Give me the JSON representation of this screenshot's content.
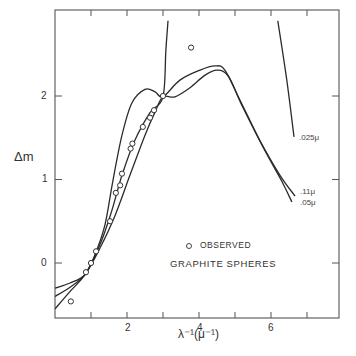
{
  "chart_data": {
    "type": "line",
    "title": "",
    "xlabel": "λ⁻¹(μ⁻¹)",
    "ylabel": "Δm",
    "xlim": [
      0,
      7.8
    ],
    "ylim": [
      -0.66,
      2.9
    ],
    "x_ticks": [
      1,
      2,
      3,
      4,
      5,
      6,
      7
    ],
    "x_tick_labels": [
      {
        "value": 2,
        "label": "2"
      },
      {
        "value": 4,
        "label": "4"
      },
      {
        "value": 6,
        "label": "6"
      }
    ],
    "y_ticks": [
      0,
      1,
      2
    ],
    "y_tick_labels": [
      {
        "value": 0,
        "label": "0"
      },
      {
        "value": 1,
        "label": "1"
      },
      {
        "value": 2,
        "label": "2"
      }
    ],
    "grid": false,
    "annotations": [
      {
        "text": "OBSERVED",
        "marker": "circle"
      },
      {
        "text": "GRAPHITE SPHERES"
      }
    ],
    "series": [
      {
        "name": ".11μ",
        "kind": "line",
        "x": [
          0,
          0.42,
          0.83,
          1.11,
          1.39,
          1.61,
          1.86,
          2.14,
          2.5,
          2.78,
          3.0,
          3.47,
          4.03,
          4.44,
          4.72,
          5.14,
          5.69,
          6.25,
          6.67
        ],
        "y": [
          -0.3,
          -0.24,
          -0.14,
          0.1,
          0.46,
          0.99,
          1.53,
          1.92,
          2.08,
          2.05,
          1.99,
          2.19,
          2.31,
          2.36,
          2.31,
          1.95,
          1.47,
          1.05,
          0.8
        ]
      },
      {
        "name": ".05μ",
        "kind": "line",
        "x": [
          0,
          0.42,
          0.83,
          1.25,
          1.67,
          2.08,
          2.5,
          2.78,
          3.0,
          3.33,
          3.75,
          4.17,
          4.5,
          4.81,
          5.19,
          5.75,
          6.31,
          6.58
        ],
        "y": [
          -0.4,
          -0.29,
          -0.14,
          0.18,
          0.57,
          1.05,
          1.53,
          1.81,
          1.99,
          1.99,
          2.1,
          2.25,
          2.31,
          2.24,
          1.89,
          1.41,
          0.97,
          0.73
        ]
      },
      {
        "name": ".025μ",
        "kind": "line",
        "segments": [
          {
            "x": [
              0,
              0.42,
              0.83,
              1.25,
              1.58,
              1.86,
              2.22,
              2.64,
              3.0,
              3.08,
              3.14
            ],
            "y": [
              -0.55,
              -0.34,
              -0.14,
              0.22,
              0.63,
              1.05,
              1.47,
              1.8,
              1.99,
              2.55,
              2.9
            ]
          },
          {
            "x": [
              6.19,
              6.44,
              6.64
            ],
            "y": [
              2.9,
              2.19,
              1.51
            ]
          }
        ]
      },
      {
        "name": "Observed",
        "kind": "scatter",
        "marker": "open-circle",
        "x": [
          0.44,
          0.86,
          1.0,
          1.14,
          1.53,
          1.69,
          1.81,
          1.86,
          2.1,
          2.15,
          2.44,
          2.64,
          2.75,
          3.0,
          3.78
        ],
        "y": [
          -0.46,
          -0.11,
          0.0,
          0.14,
          0.5,
          0.84,
          0.93,
          1.07,
          1.37,
          1.43,
          1.63,
          1.74,
          1.83,
          2.0,
          2.58
        ]
      }
    ]
  },
  "labels": {
    "ylabel": "Δm",
    "xlabel": "λ⁻¹(μ⁻¹)",
    "y_tick_0": "0",
    "y_tick_1": "1",
    "y_tick_2": "2",
    "x_tick_2": "2",
    "x_tick_4": "4",
    "x_tick_6": "6",
    "curve_025": ".025μ",
    "curve_11": ".11μ",
    "curve_05": ".05μ",
    "legend_observed": "OBSERVED",
    "legend_title": "GRAPHITE SPHERES"
  }
}
